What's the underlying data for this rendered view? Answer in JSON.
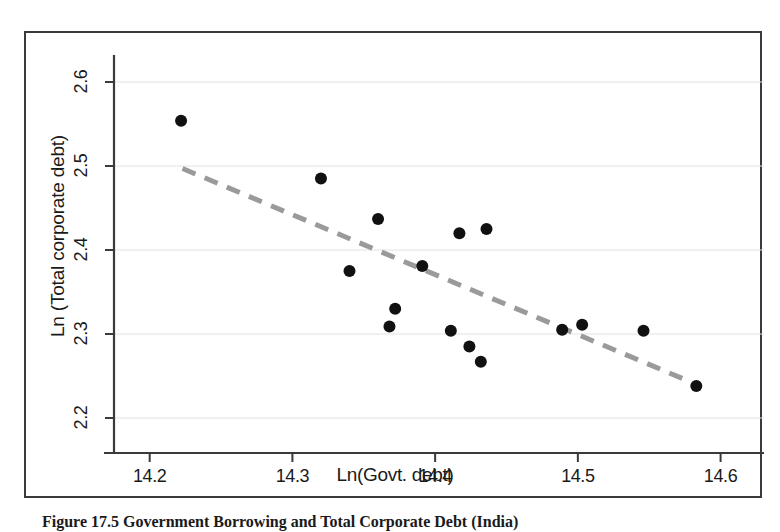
{
  "figure": {
    "caption": "Figure 17.5  Government Borrowing and Total Corporate Debt (India)"
  },
  "chart_data": {
    "type": "scatter",
    "title": "",
    "xlabel": "Ln(Govt. debt)",
    "ylabel": "Ln (Total corporate debt)",
    "xlim": [
      14.175,
      14.615
    ],
    "ylim": [
      2.175,
      2.625
    ],
    "xticks": [
      14.2,
      14.3,
      14.4,
      14.5,
      14.6
    ],
    "xtick_labels": [
      "14.2",
      "14.3",
      "14.4",
      "14.5",
      "14.6"
    ],
    "yticks": [
      2.2,
      2.3,
      2.4,
      2.5,
      2.6
    ],
    "ytick_labels": [
      "2.2",
      "2.3",
      "2.4",
      "2.5",
      "2.6"
    ],
    "grid": true,
    "grid_axis": "y",
    "grid_color": "#e2e2e2",
    "marker_color": "#111111",
    "marker_size": 9,
    "legend": null,
    "points": [
      {
        "x": 14.222,
        "y": 2.554
      },
      {
        "x": 14.32,
        "y": 2.485
      },
      {
        "x": 14.34,
        "y": 2.375
      },
      {
        "x": 14.36,
        "y": 2.437
      },
      {
        "x": 14.368,
        "y": 2.309
      },
      {
        "x": 14.372,
        "y": 2.33
      },
      {
        "x": 14.391,
        "y": 2.381
      },
      {
        "x": 14.411,
        "y": 2.304
      },
      {
        "x": 14.417,
        "y": 2.42
      },
      {
        "x": 14.424,
        "y": 2.285
      },
      {
        "x": 14.432,
        "y": 2.267
      },
      {
        "x": 14.436,
        "y": 2.425
      },
      {
        "x": 14.489,
        "y": 2.305
      },
      {
        "x": 14.503,
        "y": 2.311
      },
      {
        "x": 14.546,
        "y": 2.304
      },
      {
        "x": 14.583,
        "y": 2.238
      }
    ],
    "trendline": {
      "style": "dashed",
      "color": "#9a9a9a",
      "width": 5,
      "x_start": 14.223,
      "y_start": 2.497,
      "x_end": 14.579,
      "y_end": 2.243
    }
  }
}
